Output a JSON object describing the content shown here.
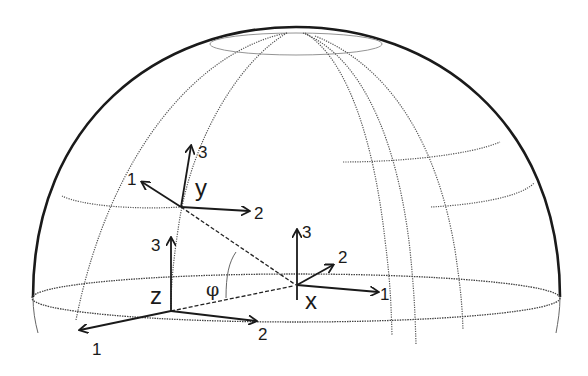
{
  "diagram": {
    "frames": [
      {
        "id": "y",
        "label": "y",
        "axes": {
          "a1": "1",
          "a2": "2",
          "a3": "3"
        }
      },
      {
        "id": "z",
        "label": "z",
        "axes": {
          "a1": "1",
          "a2": "2",
          "a3": "3"
        }
      },
      {
        "id": "x",
        "label": "x",
        "axes": {
          "a1": "1",
          "a2": "2",
          "a3": "3"
        }
      }
    ],
    "angle_label": "φ",
    "colors": {
      "line": "#1a1a1a",
      "grid": "#555555",
      "background": "#ffffff"
    }
  }
}
